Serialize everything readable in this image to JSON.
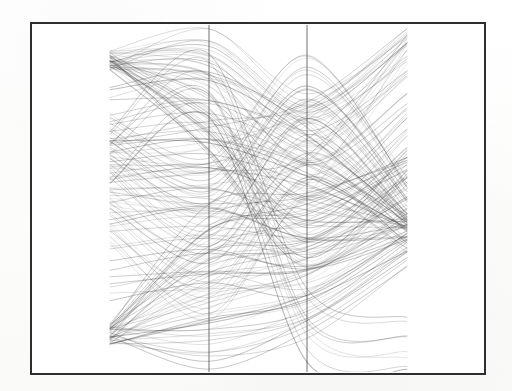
{
  "figure": {
    "kind": "parallel-coordinates-plot",
    "background_color": "#ffffff",
    "page_color": "#fdfdfc",
    "border_color": "#2e2e30",
    "border_width_px": 2,
    "frame": {
      "x": 30,
      "y": 22,
      "width": 456,
      "height": 353
    },
    "title": "",
    "caption": "",
    "axis_labels_visible": false,
    "tick_labels_visible": false
  },
  "chart_data": {
    "type": "line",
    "subtype": "parallel-coordinates",
    "title": "",
    "subtitle": "",
    "xlabel": "",
    "ylabel": "",
    "grid": false,
    "legend": "none",
    "axis_count": 4,
    "drawn_axis_count": 2,
    "categories": [
      "axis-1",
      "axis-2",
      "axis-3",
      "axis-4"
    ],
    "axis_x_positions": [
      78,
      177,
      275,
      375
    ],
    "axis_drawn": [
      false,
      true,
      true,
      false
    ],
    "axis_top": 3,
    "axis_bottom": 347,
    "ylim": [
      0,
      1
    ],
    "axis_ranges": [
      [
        0,
        1
      ],
      [
        0,
        1
      ],
      [
        0,
        1
      ],
      [
        0,
        1
      ]
    ],
    "series_count": 180,
    "ink_color": "#3a3a3c",
    "ink_opacity_range": [
      0.1,
      0.55
    ],
    "line_width_px": 0.7,
    "interpolation": "cubic-bezier",
    "bundles": [
      {
        "name": "upper-left-fan",
        "count": 46,
        "weight": 0.3,
        "v1": [
          0.9,
          0.905
        ],
        "v2": [
          0.62,
          0.99
        ],
        "v3": [
          0.3,
          0.8
        ],
        "v4": [
          0.55,
          0.99
        ]
      },
      {
        "name": "lower-left-sweep",
        "count": 44,
        "weight": 0.34,
        "v1": [
          0.1,
          0.115
        ],
        "v2": [
          0.02,
          0.46
        ],
        "v3": [
          0.1,
          0.5
        ],
        "v4": [
          0.3,
          0.62
        ]
      },
      {
        "name": "mid-crossing-band",
        "count": 38,
        "weight": 0.26,
        "v1": [
          0.38,
          0.76
        ],
        "v2": [
          0.16,
          0.62
        ],
        "v3": [
          0.5,
          0.92
        ],
        "v4": [
          0.34,
          0.56
        ]
      },
      {
        "name": "right-convergence-node",
        "count": 34,
        "weight": 0.42,
        "v1": [
          0.22,
          0.86
        ],
        "v2": [
          0.24,
          0.88
        ],
        "v3": [
          0.22,
          0.74
        ],
        "v4": [
          0.4,
          0.44
        ]
      },
      {
        "name": "outlier-arcs",
        "count": 8,
        "weight": 0.55,
        "v1": [
          0.56,
          0.72
        ],
        "v2": [
          0.74,
          0.9
        ],
        "v3": [
          0.05,
          0.22
        ],
        "v4": [
          0.02,
          0.14
        ]
      },
      {
        "name": "top-right-spike",
        "count": 18,
        "weight": 0.22,
        "v1": [
          0.48,
          0.66
        ],
        "v2": [
          0.44,
          0.7
        ],
        "v3": [
          0.52,
          0.78
        ],
        "v4": [
          0.92,
          0.995
        ]
      }
    ],
    "features": [
      {
        "name": "left-apex",
        "x": 78,
        "y": 16,
        "note": "sharp upper-left convergence point"
      },
      {
        "name": "right-apex",
        "x": 375,
        "y": 16,
        "note": "upper-right spike convergence"
      },
      {
        "name": "left-lower-cusp",
        "x": 78,
        "y": 286,
        "note": "dark lower-left convergence"
      },
      {
        "name": "axis2-bottom-cusp",
        "x": 177,
        "y": 344,
        "note": "bottom cusp on axis 2"
      },
      {
        "name": "axis3-bottom-cusp",
        "x": 275,
        "y": 344,
        "note": "bottom cusp on axis 3"
      },
      {
        "name": "right-dense-node",
        "x": 375,
        "y": 198,
        "note": "dense crossing node on right"
      },
      {
        "name": "central-eye-upper",
        "x": 226,
        "y": 150,
        "note": "large white elliptical gap"
      },
      {
        "name": "central-eye-lower",
        "x": 226,
        "y": 246,
        "note": "lower white elliptical gap"
      }
    ]
  }
}
